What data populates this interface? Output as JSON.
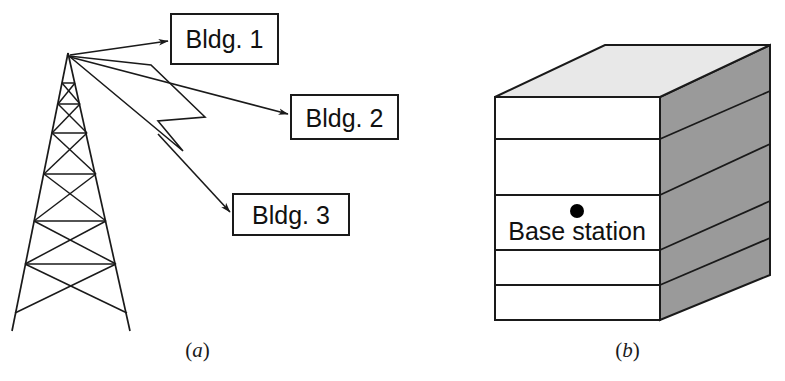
{
  "figure": {
    "panels": [
      {
        "id": "a",
        "caption_open": "(",
        "caption_letter": "a",
        "caption_close": ")",
        "description": "Lattice radio tower transmitting to three buildings",
        "tower": {
          "name": "lattice-tower",
          "apex_label": "",
          "leg_count": 2,
          "cross_brace_levels": 6
        },
        "targets": [
          {
            "id": "bldg1",
            "label": "Bldg. 1",
            "arrow": "thin"
          },
          {
            "id": "bldg2",
            "label": "Bldg. 2",
            "arrow": "thin"
          },
          {
            "id": "bldg3",
            "label": "Bldg. 3",
            "arrow": "hollow-zigzag"
          }
        ]
      },
      {
        "id": "b",
        "caption_open": "(",
        "caption_letter": "b",
        "caption_close": ")",
        "description": "Isometric multi-storey building containing the base station",
        "building": {
          "name": "base-station-building",
          "floor_count": 5,
          "marker_label": "Base station",
          "marker_shape": "filled-dot"
        }
      }
    ]
  },
  "colors": {
    "stroke": "#1a1a1a",
    "front_face": "#ffffff",
    "top_face": "#e8e8e8",
    "side_face": "#9a9a9a",
    "text": "#111111",
    "marker": "#000000",
    "background": "#ffffff"
  }
}
